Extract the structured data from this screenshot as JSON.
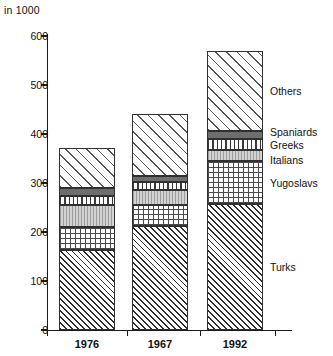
{
  "chart_data": {
    "type": "bar",
    "stacked": true,
    "title": "",
    "subtitle": "",
    "unit_note": "in 1000",
    "xlabel": "",
    "ylabel": "",
    "categories": [
      "1976",
      "1967",
      "1992"
    ],
    "ylim": [
      0,
      600
    ],
    "yticks": [
      0,
      100,
      200,
      300,
      400,
      500,
      600
    ],
    "ytick_labels": [
      "0",
      "100",
      "200",
      "300",
      "400",
      "500",
      "600"
    ],
    "grid": false,
    "legend_position": "right-inline",
    "series": [
      {
        "name": "Turks",
        "fill": "diagonal-hatch-dense",
        "values": [
          163,
          212,
          257
        ]
      },
      {
        "name": "Yugoslavs",
        "fill": "crosshatch-grid",
        "values": [
          48,
          44,
          88
        ]
      },
      {
        "name": "Italians",
        "fill": "light-gray-fine-vertical",
        "values": [
          45,
          30,
          23
        ]
      },
      {
        "name": "Greeks",
        "fill": "vertical-lines",
        "values": [
          18,
          16,
          22
        ]
      },
      {
        "name": "Spaniards",
        "fill": "solid-dark-gray",
        "values": [
          15,
          13,
          16
        ]
      },
      {
        "name": "Others",
        "fill": "diagonal-hatch-wide",
        "values": [
          82,
          125,
          164
        ]
      }
    ],
    "totals": [
      371,
      440,
      570
    ]
  },
  "legend": {
    "entries": [
      {
        "label": "Others",
        "value_at_year": 1992
      },
      {
        "label": "Spaniards",
        "value_at_year": 1992
      },
      {
        "label": "Greeks",
        "value_at_year": 1992
      },
      {
        "label": "Italians",
        "value_at_year": 1992
      },
      {
        "label": "Yugoslavs",
        "value_at_year": 1992
      },
      {
        "label": "Turks",
        "value_at_year": 1992
      }
    ]
  },
  "colors": {
    "axis": "#1a1a1a",
    "outline": "#303030",
    "spaniards_fill": "#6e6e6e",
    "italians_fill": "#d3d3d3",
    "background": "#ffffff"
  }
}
